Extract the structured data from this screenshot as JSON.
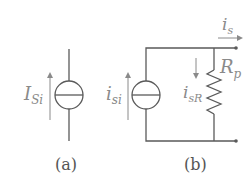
{
  "diagram": {
    "colors": {
      "wire": "#5a5a5a",
      "label": "#8a8a8a",
      "caption": "#555555",
      "background": "#ffffff"
    },
    "panel_a": {
      "caption": "(a)",
      "source_label_main": "I",
      "source_label_sub": "Si",
      "element": "independent current source"
    },
    "panel_b": {
      "caption": "(b)",
      "source_label_main": "i",
      "source_label_sub": "si",
      "resistor_label_main": "R",
      "resistor_label_sub": "p",
      "resistor_current_main": "i",
      "resistor_current_sub": "sR",
      "output_current_main": "i",
      "output_current_sub": "s",
      "element": "current source with parallel resistor"
    }
  }
}
